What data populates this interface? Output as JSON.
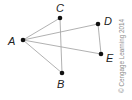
{
  "graph": {
    "nodes": [
      {
        "id": "A",
        "label": "A"
      },
      {
        "id": "B",
        "label": "B"
      },
      {
        "id": "C",
        "label": "C"
      },
      {
        "id": "D",
        "label": "D"
      },
      {
        "id": "E",
        "label": "E"
      }
    ],
    "edges": [
      [
        "A",
        "C"
      ],
      [
        "A",
        "D"
      ],
      [
        "A",
        "E"
      ],
      [
        "A",
        "B"
      ],
      [
        "C",
        "B"
      ],
      [
        "D",
        "E"
      ]
    ]
  },
  "copyright": "© Cengage Learning 2014"
}
